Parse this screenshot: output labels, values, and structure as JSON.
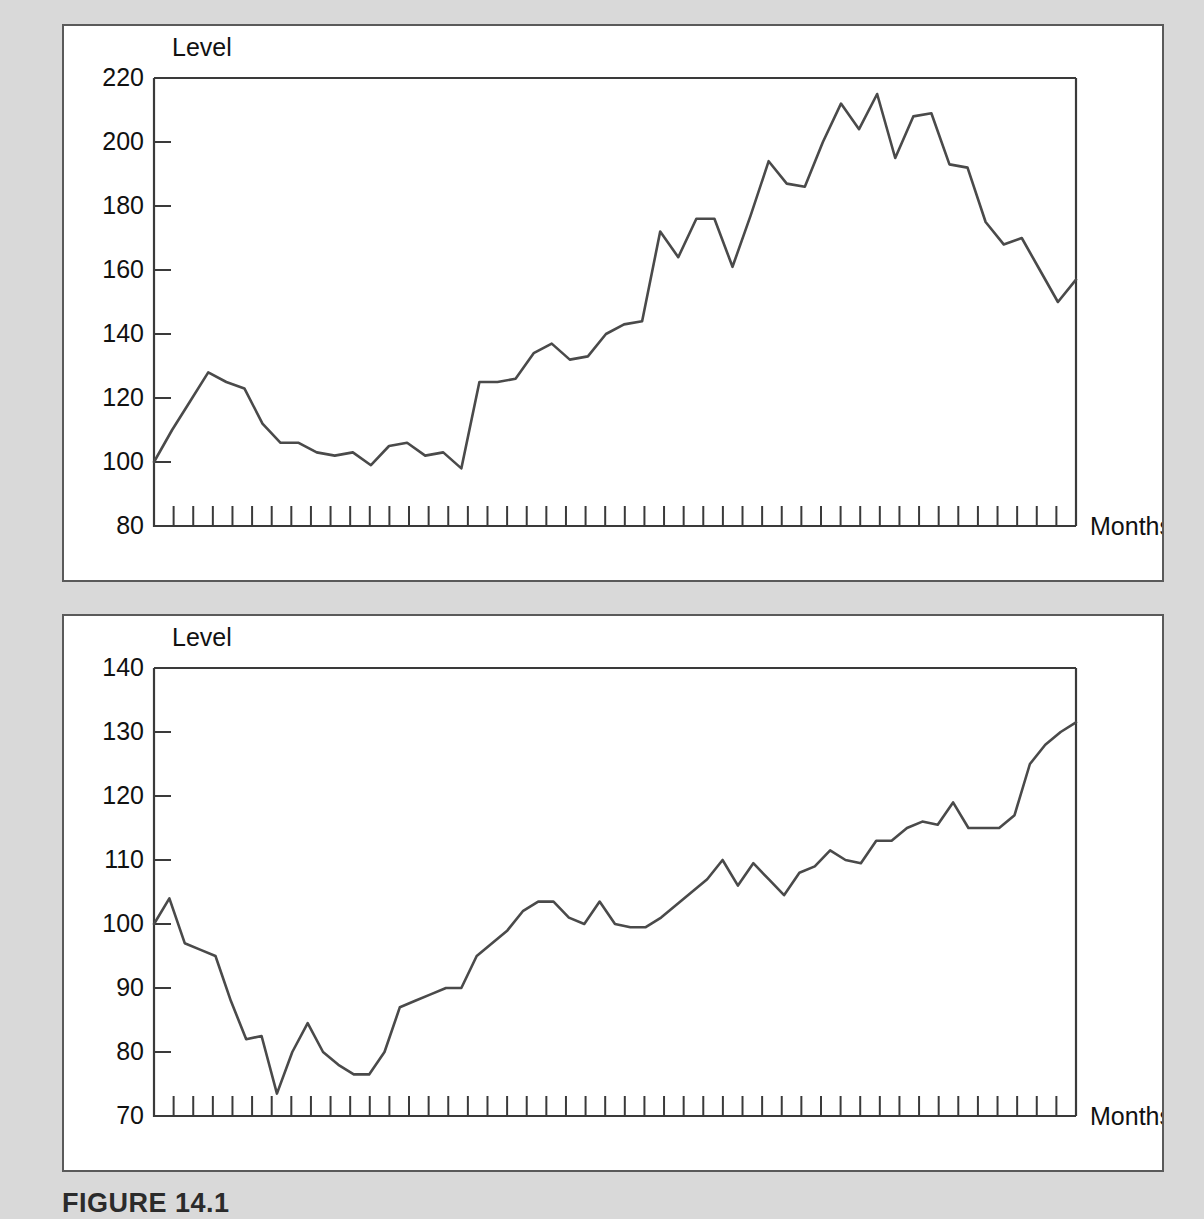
{
  "figure": {
    "caption": "FIGURE 14.1",
    "background_color": "#d9d9d9",
    "panel_color": "#ffffff",
    "line_color": "#4a4a4a",
    "axis_color": "#3a3a3a"
  },
  "chart_data": [
    {
      "type": "line",
      "title": "",
      "panel": "top",
      "ylabel": "Level",
      "xlabel": "Months",
      "ylim": [
        80,
        220
      ],
      "yticks": [
        80,
        100,
        120,
        140,
        160,
        180,
        200,
        220
      ],
      "ytick_labels": [
        "80",
        "100",
        "120",
        "140",
        "160",
        "180",
        "200",
        "220"
      ],
      "xlim": [
        1,
        48
      ],
      "n_xticks": 48,
      "grid": false,
      "legend": null,
      "x": [
        1,
        2,
        3,
        4,
        5,
        6,
        7,
        8,
        9,
        10,
        11,
        12,
        13,
        14,
        15,
        16,
        17,
        18,
        19,
        20,
        21,
        22,
        23,
        24,
        25,
        26,
        27,
        28,
        29,
        30,
        31,
        32,
        33,
        34,
        35,
        36,
        37,
        38,
        39,
        40,
        41,
        42,
        43,
        44,
        45,
        46,
        47,
        48
      ],
      "values": [
        100,
        110,
        119,
        128,
        125,
        123,
        112,
        106,
        106,
        103,
        102,
        103,
        99,
        105,
        106,
        102,
        103,
        98,
        125,
        125,
        126,
        134,
        137,
        132,
        133,
        140,
        143,
        144,
        172,
        164,
        176,
        176,
        161,
        177,
        194,
        187,
        186,
        200,
        212,
        204,
        215,
        195,
        208,
        209,
        193,
        192,
        175,
        168,
        170,
        160,
        150,
        157
      ]
    },
    {
      "type": "line",
      "title": "",
      "panel": "bottom",
      "ylabel": "Level",
      "xlabel": "Months",
      "ylim": [
        70,
        140
      ],
      "yticks": [
        70,
        80,
        90,
        100,
        110,
        120,
        130,
        140
      ],
      "ytick_labels": [
        "70",
        "80",
        "90",
        "100",
        "110",
        "120",
        "130",
        "140"
      ],
      "xlim": [
        1,
        48
      ],
      "n_xticks": 48,
      "grid": false,
      "legend": null,
      "x": [
        1,
        2,
        3,
        4,
        5,
        6,
        7,
        8,
        9,
        10,
        11,
        12,
        13,
        14,
        15,
        16,
        17,
        18,
        19,
        20,
        21,
        22,
        23,
        24,
        25,
        26,
        27,
        28,
        29,
        30,
        31,
        32,
        33,
        34,
        35,
        36,
        37,
        38,
        39,
        40,
        41,
        42,
        43,
        44,
        45,
        46,
        47,
        48
      ],
      "values": [
        100,
        104,
        97,
        96,
        95,
        88,
        82,
        82.5,
        73.5,
        80,
        84.5,
        80,
        78,
        76.5,
        76.5,
        80,
        87,
        88,
        89,
        90,
        90,
        95,
        97,
        99,
        102,
        103.5,
        103.5,
        101,
        100,
        103.5,
        100,
        99.5,
        99.5,
        101,
        103,
        105,
        107,
        110,
        106,
        109.5,
        107,
        104.5,
        108,
        109,
        111.5,
        110,
        109.5,
        113,
        113,
        115,
        116,
        115.5,
        119,
        115,
        115,
        115,
        117,
        125,
        128,
        130,
        131.5
      ]
    }
  ],
  "axis_text": {
    "level": "Level",
    "months": "Months"
  }
}
